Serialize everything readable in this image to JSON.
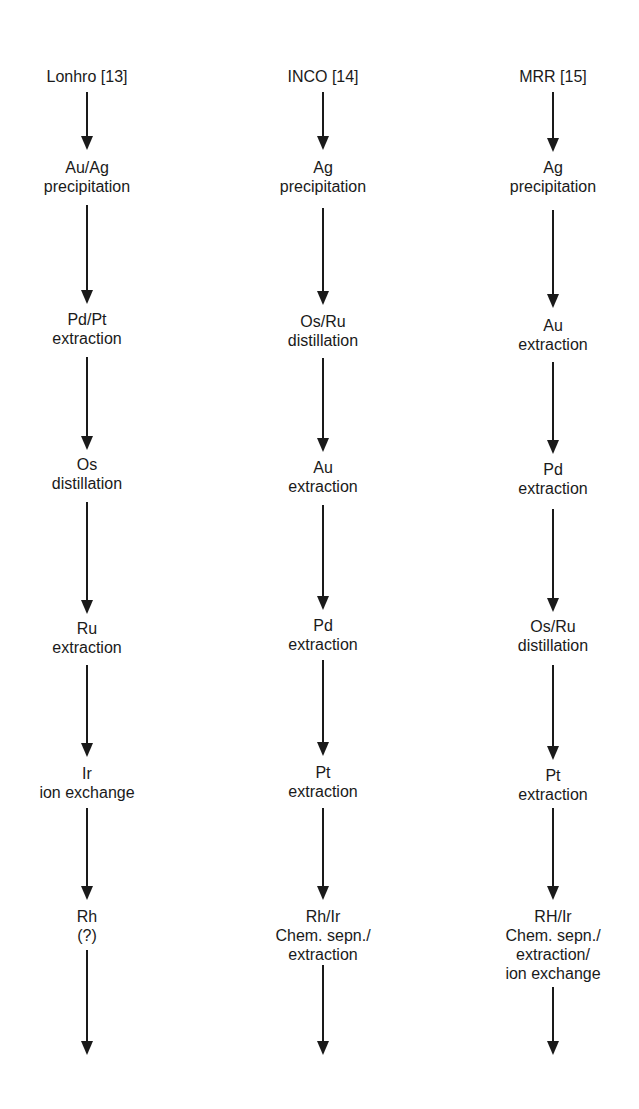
{
  "diagram": {
    "type": "parallel process flow",
    "columns": [
      {
        "center_x": 87,
        "header": "Lonhro [13]",
        "header_y": 67,
        "steps": [
          {
            "lines": [
              "Au/Ag",
              "precipitation"
            ],
            "y": 158
          },
          {
            "lines": [
              "Pd/Pt",
              "extraction"
            ],
            "y": 310
          },
          {
            "lines": [
              "Os",
              "distillation"
            ],
            "y": 455
          },
          {
            "lines": [
              "Ru",
              "extraction"
            ],
            "y": 619
          },
          {
            "lines": [
              "Ir",
              "ion exchange"
            ],
            "y": 764
          },
          {
            "lines": [
              "Rh",
              "(?)"
            ],
            "y": 907
          }
        ],
        "arrows": [
          [
            92,
            150
          ],
          [
            205,
            304
          ],
          [
            357,
            450
          ],
          [
            502,
            614
          ],
          [
            665,
            757
          ],
          [
            808,
            900
          ],
          [
            950,
            1055
          ]
        ]
      },
      {
        "center_x": 323,
        "header": "INCO [14]",
        "header_y": 67,
        "steps": [
          {
            "lines": [
              "Ag",
              "precipitation"
            ],
            "y": 158
          },
          {
            "lines": [
              "Os/Ru",
              "distillation"
            ],
            "y": 312
          },
          {
            "lines": [
              "Au",
              "extraction"
            ],
            "y": 458
          },
          {
            "lines": [
              "Pd",
              "extraction"
            ],
            "y": 616
          },
          {
            "lines": [
              "Pt",
              "extraction"
            ],
            "y": 763
          },
          {
            "lines": [
              "Rh/Ir",
              "Chem. sepn./",
              "extraction"
            ],
            "y": 907
          }
        ],
        "arrows": [
          [
            92,
            150
          ],
          [
            208,
            305
          ],
          [
            358,
            452
          ],
          [
            505,
            610
          ],
          [
            660,
            756
          ],
          [
            808,
            900
          ],
          [
            965,
            1055
          ]
        ]
      },
      {
        "center_x": 553,
        "header": "MRR [15]",
        "header_y": 67,
        "steps": [
          {
            "lines": [
              "Ag",
              "precipitation"
            ],
            "y": 158
          },
          {
            "lines": [
              "Au",
              "extraction"
            ],
            "y": 316
          },
          {
            "lines": [
              "Pd",
              "extraction"
            ],
            "y": 460
          },
          {
            "lines": [
              "Os/Ru",
              "distillation"
            ],
            "y": 617
          },
          {
            "lines": [
              "Pt",
              "extraction"
            ],
            "y": 766
          },
          {
            "lines": [
              "RH/Ir",
              "Chem. sepn./",
              "extraction/",
              "ion exchange"
            ],
            "y": 907
          }
        ],
        "arrows": [
          [
            92,
            152
          ],
          [
            210,
            308
          ],
          [
            362,
            454
          ],
          [
            509,
            612
          ],
          [
            665,
            760
          ],
          [
            808,
            900
          ],
          [
            987,
            1055
          ]
        ]
      }
    ]
  }
}
